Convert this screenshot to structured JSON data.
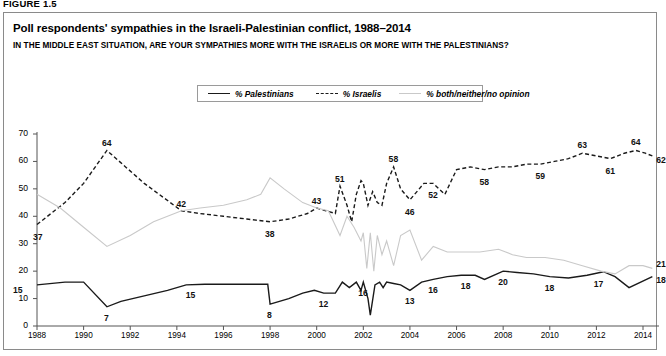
{
  "figure": {
    "label": "FIGURE 1.5"
  },
  "header": {
    "title": "Poll respondents' sympathies in the Israeli-Palestinian conflict, 1988–2014",
    "subtitle": "IN THE MIDDLE EAST SITUATION, ARE YOUR SYMPATHIES MORE WITH THE ISRAELIS OR MORE WITH THE PALESTINIANS?"
  },
  "legend": {
    "items": [
      {
        "label": "% Palestinians",
        "style": "solid",
        "color": "#1a1a1a"
      },
      {
        "label": "% Israelis",
        "style": "dashed",
        "color": "#1a1a1a"
      },
      {
        "label": "% both/neither/no opinion",
        "style": "solid-light",
        "color": "#c9c9c9"
      }
    ]
  },
  "chart_data": {
    "type": "line",
    "title": "Poll respondents' sympathies in the Israeli-Palestinian conflict, 1988–2014",
    "subtitle": "IN THE MIDDLE EAST SITUATION, ARE YOUR SYMPATHIES MORE WITH THE ISRAELIS OR MORE WITH THE PALESTINIANS?",
    "xlabel": "",
    "ylabel": "",
    "xlim": [
      1988,
      2014.6
    ],
    "ylim": [
      0,
      70
    ],
    "yticks": [
      0,
      10,
      20,
      30,
      40,
      50,
      60,
      70
    ],
    "xticks": [
      1988,
      1990,
      1992,
      1994,
      1996,
      1998,
      2000,
      2002,
      2004,
      2006,
      2008,
      2010,
      2012,
      2014
    ],
    "grid": false,
    "legend_position": "top-center",
    "series": [
      {
        "name": "% Palestinians",
        "style": "solid",
        "color": "#1a1a1a",
        "points": [
          [
            1988.0,
            15
          ],
          [
            1989.2,
            16
          ],
          [
            1990.0,
            16
          ],
          [
            1991.0,
            7
          ],
          [
            1991.6,
            9
          ],
          [
            1992.6,
            11
          ],
          [
            1993.6,
            13
          ],
          [
            1994.4,
            15
          ],
          [
            1995.2,
            15.2
          ],
          [
            1996.2,
            15.2
          ],
          [
            1997.2,
            15.2
          ],
          [
            1997.9,
            15.2
          ],
          [
            1998.0,
            8
          ],
          [
            1998.8,
            10
          ],
          [
            1999.4,
            12
          ],
          [
            1999.9,
            13
          ],
          [
            2000.3,
            12
          ],
          [
            2000.8,
            12
          ],
          [
            2001.1,
            16
          ],
          [
            2001.4,
            14
          ],
          [
            2001.7,
            16
          ],
          [
            2001.9,
            13
          ],
          [
            2002.0,
            16
          ],
          [
            2002.2,
            10
          ],
          [
            2002.3,
            4
          ],
          [
            2002.5,
            15
          ],
          [
            2002.7,
            16
          ],
          [
            2002.85,
            14
          ],
          [
            2003.0,
            16
          ],
          [
            2003.3,
            15.5
          ],
          [
            2003.6,
            15
          ],
          [
            2004.0,
            13
          ],
          [
            2004.5,
            16
          ],
          [
            2005.0,
            17
          ],
          [
            2005.6,
            18
          ],
          [
            2006.2,
            18.5
          ],
          [
            2006.8,
            18.5
          ],
          [
            2007.2,
            17
          ],
          [
            2008.0,
            20
          ],
          [
            2008.6,
            19.5
          ],
          [
            2009.3,
            19
          ],
          [
            2010.0,
            18
          ],
          [
            2010.8,
            17.5
          ],
          [
            2011.6,
            18.5
          ],
          [
            2012.3,
            19.8
          ],
          [
            2012.8,
            18
          ],
          [
            2013.4,
            14
          ],
          [
            2014.4,
            18
          ]
        ]
      },
      {
        "name": "% Israelis",
        "style": "dashed",
        "color": "#1a1a1a",
        "points": [
          [
            1988.0,
            37
          ],
          [
            1989.2,
            45
          ],
          [
            1990.0,
            52
          ],
          [
            1991.0,
            64
          ],
          [
            1991.8,
            58
          ],
          [
            1992.6,
            52
          ],
          [
            1993.4,
            47
          ],
          [
            1994.2,
            42
          ],
          [
            1995.0,
            41
          ],
          [
            1996.0,
            40
          ],
          [
            1997.0,
            39
          ],
          [
            1998.0,
            38
          ],
          [
            1998.8,
            39
          ],
          [
            1999.6,
            41
          ],
          [
            2000.0,
            43
          ],
          [
            2000.4,
            42
          ],
          [
            2000.8,
            41
          ],
          [
            2001.0,
            51
          ],
          [
            2001.3,
            44
          ],
          [
            2001.5,
            38
          ],
          [
            2001.7,
            48
          ],
          [
            2001.9,
            53
          ],
          [
            2002.0,
            52
          ],
          [
            2002.2,
            44
          ],
          [
            2002.4,
            49
          ],
          [
            2002.6,
            45
          ],
          [
            2002.8,
            44
          ],
          [
            2003.0,
            52
          ],
          [
            2003.3,
            58
          ],
          [
            2003.6,
            50
          ],
          [
            2004.0,
            46
          ],
          [
            2004.6,
            52
          ],
          [
            2005.0,
            52
          ],
          [
            2005.5,
            48
          ],
          [
            2006.0,
            57
          ],
          [
            2006.6,
            58
          ],
          [
            2007.2,
            57
          ],
          [
            2007.8,
            58
          ],
          [
            2008.4,
            58
          ],
          [
            2009.0,
            59
          ],
          [
            2009.6,
            59
          ],
          [
            2010.2,
            60
          ],
          [
            2010.8,
            61
          ],
          [
            2011.4,
            63
          ],
          [
            2012.0,
            62
          ],
          [
            2012.6,
            61
          ],
          [
            2013.2,
            63
          ],
          [
            2013.7,
            64
          ],
          [
            2014.1,
            63
          ],
          [
            2014.4,
            62
          ]
        ]
      },
      {
        "name": "% both/neither/no opinion",
        "style": "solid-light",
        "color": "#c9c9c9",
        "points": [
          [
            1988.0,
            48
          ],
          [
            1989.0,
            43
          ],
          [
            1990.0,
            36
          ],
          [
            1991.0,
            29
          ],
          [
            1992.0,
            33
          ],
          [
            1993.0,
            38
          ],
          [
            1994.2,
            42
          ],
          [
            1995.0,
            43
          ],
          [
            1996.0,
            44
          ],
          [
            1997.0,
            46
          ],
          [
            1997.6,
            48
          ],
          [
            1998.0,
            54
          ],
          [
            1998.6,
            50
          ],
          [
            1999.4,
            45
          ],
          [
            2000.0,
            43
          ],
          [
            2000.5,
            42
          ],
          [
            2001.0,
            33
          ],
          [
            2001.3,
            40
          ],
          [
            2001.6,
            36
          ],
          [
            2001.9,
            31
          ],
          [
            2002.0,
            34
          ],
          [
            2002.15,
            21
          ],
          [
            2002.3,
            34
          ],
          [
            2002.45,
            20
          ],
          [
            2002.6,
            33
          ],
          [
            2002.8,
            26
          ],
          [
            2003.0,
            31
          ],
          [
            2003.3,
            22
          ],
          [
            2003.6,
            33
          ],
          [
            2004.0,
            35
          ],
          [
            2004.5,
            24
          ],
          [
            2005.0,
            29
          ],
          [
            2005.6,
            27
          ],
          [
            2006.3,
            27
          ],
          [
            2007.0,
            27
          ],
          [
            2007.8,
            28
          ],
          [
            2008.4,
            26
          ],
          [
            2009.0,
            25
          ],
          [
            2009.8,
            25
          ],
          [
            2010.6,
            24
          ],
          [
            2011.4,
            22
          ],
          [
            2012.2,
            20
          ],
          [
            2012.8,
            19
          ],
          [
            2013.4,
            22
          ],
          [
            2014.0,
            22
          ],
          [
            2014.4,
            21
          ]
        ]
      }
    ],
    "point_labels": [
      {
        "series": "% Palestinians",
        "value": "15",
        "x": 1988.0,
        "y": 15,
        "dx": -24,
        "dy": 6
      },
      {
        "series": "% Palestinians",
        "value": "7",
        "x": 1991.0,
        "y": 7,
        "dx": -3,
        "dy": 12
      },
      {
        "series": "% Palestinians",
        "value": "15",
        "x": 1994.6,
        "y": 15.2,
        "dx": -5,
        "dy": 12
      },
      {
        "series": "% Palestinians",
        "value": "8",
        "x": 1998.0,
        "y": 8,
        "dx": -3,
        "dy": 12
      },
      {
        "series": "% Palestinians",
        "value": "12",
        "x": 2000.3,
        "y": 12,
        "dx": -5,
        "dy": 12
      },
      {
        "series": "% Palestinians",
        "value": "16",
        "x": 2002.0,
        "y": 16,
        "dx": -5,
        "dy": 12
      },
      {
        "series": "% Palestinians",
        "value": "13",
        "x": 2004.0,
        "y": 13,
        "dx": -5,
        "dy": 12
      },
      {
        "series": "% Palestinians",
        "value": "16",
        "x": 2005.0,
        "y": 17,
        "dx": -5,
        "dy": 12
      },
      {
        "series": "% Palestinians",
        "value": "18",
        "x": 2006.4,
        "y": 18.5,
        "dx": -5,
        "dy": 12
      },
      {
        "series": "% Palestinians",
        "value": "20",
        "x": 2008.0,
        "y": 20,
        "dx": -5,
        "dy": 12
      },
      {
        "series": "% Palestinians",
        "value": "18",
        "x": 2010.0,
        "y": 18,
        "dx": -5,
        "dy": 12
      },
      {
        "series": "% Palestinians",
        "value": "17",
        "x": 2012.1,
        "y": 19.4,
        "dx": -5,
        "dy": 12
      },
      {
        "series": "% Palestinians",
        "value": "18",
        "x": 2014.4,
        "y": 18,
        "dx": 4,
        "dy": 4
      },
      {
        "series": "% Israelis",
        "value": "37",
        "x": 1988.0,
        "y": 37,
        "dx": -4,
        "dy": 13
      },
      {
        "series": "% Israelis",
        "value": "64",
        "x": 1991.0,
        "y": 64,
        "dx": -5,
        "dy": -6
      },
      {
        "series": "% Israelis",
        "value": "42",
        "x": 1994.2,
        "y": 42,
        "dx": -5,
        "dy": -6
      },
      {
        "series": "% Israelis",
        "value": "38",
        "x": 1998.0,
        "y": 38,
        "dx": -5,
        "dy": 13
      },
      {
        "series": "% Israelis",
        "value": "43",
        "x": 2000.0,
        "y": 43,
        "dx": -5,
        "dy": -6
      },
      {
        "series": "% Israelis",
        "value": "51",
        "x": 2001.0,
        "y": 51,
        "dx": -5,
        "dy": -6
      },
      {
        "series": "% Israelis",
        "value": "58",
        "x": 2003.3,
        "y": 58,
        "dx": -5,
        "dy": -7
      },
      {
        "series": "% Israelis",
        "value": "46",
        "x": 2004.0,
        "y": 46,
        "dx": -5,
        "dy": 13
      },
      {
        "series": "% Israelis",
        "value": "52",
        "x": 2005.0,
        "y": 52,
        "dx": -5,
        "dy": 13
      },
      {
        "series": "% Israelis",
        "value": "58",
        "x": 2007.2,
        "y": 57,
        "dx": -5,
        "dy": 13
      },
      {
        "series": "% Israelis",
        "value": "59",
        "x": 2009.6,
        "y": 59,
        "dx": -5,
        "dy": 13
      },
      {
        "series": "% Israelis",
        "value": "63",
        "x": 2011.4,
        "y": 63,
        "dx": -5,
        "dy": -7
      },
      {
        "series": "% Israelis",
        "value": "61",
        "x": 2012.6,
        "y": 61,
        "dx": -5,
        "dy": 13
      },
      {
        "series": "% Israelis",
        "value": "64",
        "x": 2013.7,
        "y": 64,
        "dx": -5,
        "dy": -7
      },
      {
        "series": "% Israelis",
        "value": "62",
        "x": 2014.4,
        "y": 62,
        "dx": 4,
        "dy": 5
      },
      {
        "series": "% both/neither/no opinion",
        "value": "21",
        "x": 2014.4,
        "y": 21,
        "dx": 4,
        "dy": -3
      }
    ]
  }
}
